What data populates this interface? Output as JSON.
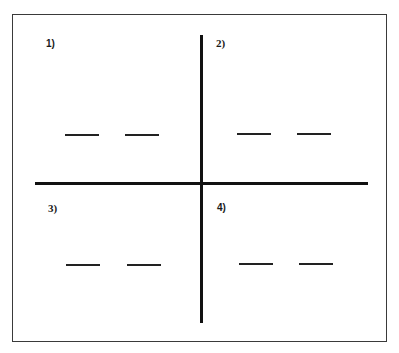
{
  "diagram": {
    "type": "four-quadrant worksheet",
    "stroke_color": "#111111",
    "frame_color": "#3a3a3a",
    "background": "#ffffff",
    "quadrants": [
      {
        "label": "1)",
        "blanks": [
          "",
          ""
        ]
      },
      {
        "label": "2)",
        "blanks": [
          "",
          ""
        ]
      },
      {
        "label": "3)",
        "blanks": [
          "",
          ""
        ]
      },
      {
        "label": "4)",
        "blanks": [
          "",
          ""
        ]
      }
    ]
  }
}
